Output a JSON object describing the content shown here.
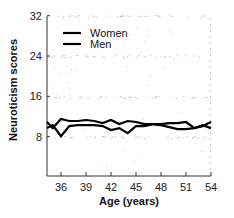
{
  "chart_data": {
    "type": "line",
    "title": "",
    "xlabel": "Age (years)",
    "ylabel": "Neuroticism scores",
    "xlim": [
      34,
      54
    ],
    "ylim": [
      0,
      32
    ],
    "xticks": [
      36,
      39,
      42,
      45,
      48,
      51,
      54
    ],
    "yticks": [
      8,
      16,
      24,
      32
    ],
    "grid": false,
    "legend_position": "upper left",
    "x": [
      34,
      35,
      36,
      37,
      38,
      39,
      40,
      41,
      42,
      43,
      44,
      45,
      46,
      47,
      48,
      49,
      50,
      51,
      52,
      53,
      54
    ],
    "series": [
      {
        "name": "Women",
        "color": "#000000",
        "values": [
          10.9,
          9.7,
          11.5,
          11.1,
          11.1,
          11.3,
          11.1,
          10.7,
          11.3,
          10.5,
          11.1,
          10.9,
          10.5,
          10.5,
          10.3,
          9.9,
          9.5,
          9.5,
          9.7,
          10.1,
          10.9
        ]
      },
      {
        "name": "Men",
        "color": "#000000",
        "values": [
          9.7,
          10.3,
          8.1,
          10.1,
          10.3,
          10.3,
          10.3,
          10.1,
          9.3,
          9.7,
          8.7,
          10.1,
          10.1,
          10.5,
          10.5,
          10.7,
          10.7,
          10.9,
          9.7,
          10.3,
          9.7
        ]
      }
    ]
  },
  "labels": {
    "xlabel": "Age (years)",
    "ylabel": "Neuroticism scores"
  },
  "legend": [
    {
      "label": "Women"
    },
    {
      "label": "Men"
    }
  ]
}
